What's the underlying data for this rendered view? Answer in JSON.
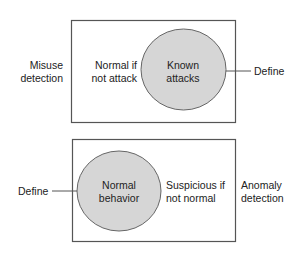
{
  "colors": {
    "box_stroke": "#555555",
    "circle_fill": "#d6d6d6",
    "circle_stroke": "#666666",
    "text": "#222222"
  },
  "misuse_panel": {
    "side_label": [
      "Misuse",
      "detection"
    ],
    "outside_label": [
      "Normal if",
      "not attack"
    ],
    "circle_label": [
      "Known",
      "attacks"
    ],
    "define_label": "Define"
  },
  "anomaly_panel": {
    "side_label": [
      "Anomaly",
      "detection"
    ],
    "outside_label": [
      "Suspicious if",
      "not normal"
    ],
    "circle_label": [
      "Normal",
      "behavior"
    ],
    "define_label": "Define"
  }
}
